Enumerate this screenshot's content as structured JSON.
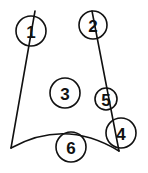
{
  "diagram": {
    "type": "labeled-outline",
    "colors": {
      "stroke": "#111111",
      "background": "#ffffff"
    },
    "outline": {
      "left_edge": {
        "from": [
          35,
          11
        ],
        "to": [
          11,
          148
        ]
      },
      "right_edge": {
        "from": [
          92,
          11
        ],
        "to": [
          119,
          151
        ]
      },
      "bottom_curve": {
        "from": [
          11,
          148
        ],
        "control": [
          65,
          118
        ],
        "to": [
          119,
          151
        ]
      }
    },
    "markers": [
      {
        "id": "1",
        "label": "1",
        "cx": 31,
        "cy": 31,
        "r": 15
      },
      {
        "id": "2",
        "label": "2",
        "cx": 93,
        "cy": 25,
        "r": 14
      },
      {
        "id": "3",
        "label": "3",
        "cx": 65,
        "cy": 93,
        "r": 15
      },
      {
        "id": "5",
        "label": "5",
        "cx": 106,
        "cy": 99,
        "r": 11
      },
      {
        "id": "4",
        "label": "4",
        "cx": 121,
        "cy": 133,
        "r": 15
      },
      {
        "id": "6",
        "label": "6",
        "cx": 71,
        "cy": 147,
        "r": 15
      }
    ]
  }
}
